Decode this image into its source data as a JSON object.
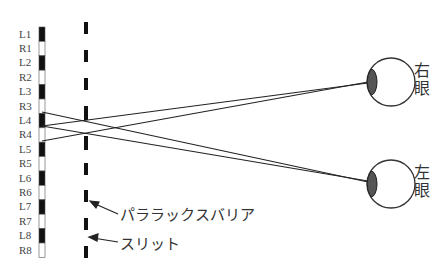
{
  "diagram": {
    "type": "parallax-barrier-autostereoscopic",
    "pixel_labels": [
      "L1",
      "R1",
      "L2",
      "R2",
      "L3",
      "R3",
      "L4",
      "R4",
      "L5",
      "R5",
      "L6",
      "R6",
      "L7",
      "R7",
      "L8",
      "R8"
    ],
    "labels": {
      "barrier": "パララックスバリア",
      "slit": "スリット",
      "right_eye": [
        "右",
        "眼"
      ],
      "left_eye": [
        "左",
        "眼"
      ]
    },
    "colors": {
      "line": "#222222",
      "pixel_dark": "#111111",
      "pupil": "#555555"
    }
  }
}
